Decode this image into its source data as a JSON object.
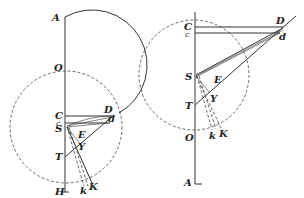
{
  "diagram": {
    "left_figure": {
      "labels": {
        "A": "A",
        "O": "O",
        "C": "C",
        "c": "c",
        "S": "S",
        "D": "D",
        "d": "d",
        "E": "E",
        "Y": "Y",
        "T": "T",
        "H": "H",
        "k": "k",
        "K": "K"
      }
    },
    "right_figure": {
      "labels": {
        "C": "C",
        "c": "c",
        "D": "D",
        "d": "d",
        "S": "S",
        "E": "E",
        "Y": "Y",
        "T": "T",
        "O": "O",
        "k": "k",
        "K": "K",
        "A": "A"
      }
    },
    "colors": {
      "stroke": "#333333",
      "background": "#ffffff"
    }
  }
}
